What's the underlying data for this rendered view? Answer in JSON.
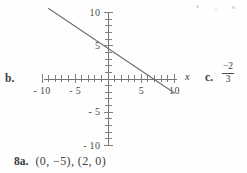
{
  "document": {
    "kind": "scanned-answer-key-excerpt"
  },
  "parts": {
    "b_label": "b.",
    "c_label": "c.",
    "c_answer_numerator": "−2",
    "c_answer_denominator": "3"
  },
  "answer_row": {
    "number": "8a.",
    "value": "(0, −5), (2, 0)"
  },
  "graph": {
    "axis_x_label": "x",
    "x_tick_labels": [
      {
        "value": -10,
        "text": "- 10"
      },
      {
        "value": -5,
        "text": "- 5"
      },
      {
        "value": 5,
        "text": "5"
      },
      {
        "value": 10,
        "text": "10"
      }
    ],
    "y_tick_labels": [
      {
        "value": 10,
        "text": "10"
      },
      {
        "value": 5,
        "text": "5"
      },
      {
        "value": -5,
        "text": "- 5"
      },
      {
        "value": -10,
        "text": "- 10"
      }
    ]
  },
  "chart_data": {
    "type": "line",
    "title": "",
    "xlabel": "x",
    "ylabel": "",
    "xlim": [
      -10,
      10
    ],
    "ylim": [
      -10,
      10
    ],
    "xticks": [
      -10,
      -5,
      5,
      10
    ],
    "yticks": [
      -10,
      -5,
      5,
      10
    ],
    "minor_tick_interval": 1,
    "grid": false,
    "legend": false,
    "series": [
      {
        "name": "line",
        "x": [
          -9,
          10
        ],
        "y": [
          10.6,
          -2.1
        ],
        "y_intercept": 4.7,
        "x_intercept": 6.5,
        "slope": -0.6667
      }
    ]
  },
  "colors": {
    "ink": "#4a4a4a",
    "axis": "#737373",
    "paper": "#fefefe"
  }
}
